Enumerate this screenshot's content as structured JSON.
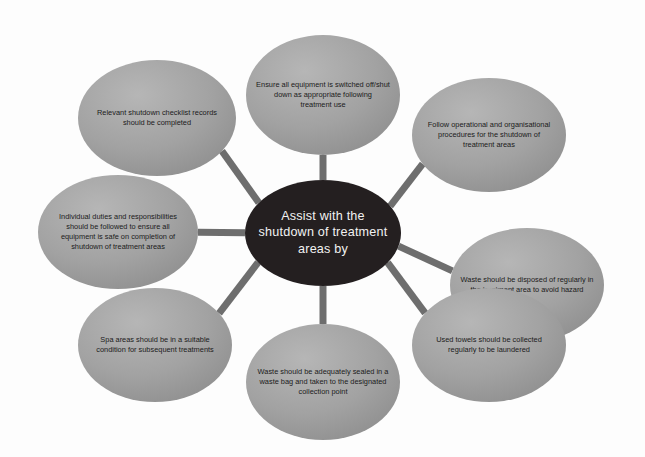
{
  "diagram": {
    "type": "radial-hub-and-spoke",
    "colors": {
      "background": "#fdfdfd",
      "center_fill": "#241f20",
      "center_text": "#f2f2f2",
      "node_fill_light": "#b0b0b0",
      "node_fill_dark": "#8e8e8e",
      "node_text": "#1b1b1b",
      "spoke": "#6e6e6e"
    },
    "center": {
      "label": "Assist with the shutdown of treatment areas by",
      "lines": [
        "Assist with the",
        "shutdown of treatment",
        "areas by"
      ],
      "cx": 323,
      "cy": 233,
      "rx": 78,
      "ry": 53
    },
    "nodes": [
      {
        "id": "equipment-switched-off",
        "label": "Ensure all equipment is switched off/shut down as appropriate following treatment use",
        "lines": [
          "Ensure all equipment is switched off/shut",
          "down as appropriate following",
          "treatment use"
        ],
        "cx": 323,
        "cy": 95,
        "rx": 77,
        "ry": 60
      },
      {
        "id": "operational-procedures",
        "label": "Follow operational and organisational procedures for the shutdown of treatment areas",
        "lines": [
          "Follow operational and organisational",
          "procedures for the shutdown of",
          "treatment areas"
        ],
        "cx": 489,
        "cy": 135,
        "rx": 77,
        "ry": 57
      },
      {
        "id": "waste-disposed-regularly",
        "label": "Waste should be disposed of regularly in the treatment area to avoid hazard",
        "lines": [
          "Waste should be disposed of regularly in",
          "the treatment area to avoid hazard"
        ],
        "cx": 527,
        "cy": 285,
        "rx": 77,
        "ry": 57
      },
      {
        "id": "used-towels-collected",
        "label": "Used towels should be collected regularly to be laundered",
        "lines": [
          "Used towels should be collected",
          "regularly to be laundered"
        ],
        "cx": 489,
        "cy": 345,
        "rx": 77,
        "ry": 57
      },
      {
        "id": "waste-sealed-in-bag",
        "label": "Waste should be adequately sealed in a waste bag and taken to the designated collection point",
        "lines": [
          "Waste should be adequately sealed in a",
          "waste bag and taken to the designated",
          "collection point"
        ],
        "cx": 323,
        "cy": 382,
        "rx": 77,
        "ry": 58
      },
      {
        "id": "spa-areas-suitable",
        "label": "Spa areas should be in a suitable condition for subsequent treatments",
        "lines": [
          "Spa areas should be in a suitable",
          "condition for subsequent treatments"
        ],
        "cx": 155,
        "cy": 345,
        "rx": 77,
        "ry": 57
      },
      {
        "id": "individual-duties",
        "label": "Individual duties and responsibilities should be followed to ensure all equipment is safe on completion of shutdown of treatment areas",
        "lines": [
          "Individual duties and responsibilities",
          "should be followed to ensure all",
          "equipment is safe on completion of",
          "shutdown of treatment areas"
        ],
        "cx": 118,
        "cy": 232,
        "rx": 80,
        "ry": 57
      },
      {
        "id": "shutdown-checklist-records",
        "label": "Relevant shutdown checklist records should be completed",
        "lines": [
          "Relevant shutdown checklist records",
          "should be completed"
        ],
        "cx": 157,
        "cy": 118,
        "rx": 79,
        "ry": 58
      }
    ]
  }
}
